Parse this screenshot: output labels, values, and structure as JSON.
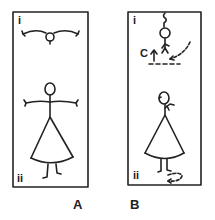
{
  "panels": [
    {
      "id": "A",
      "caption": "A",
      "top_label": "i",
      "bottom_label": "ii",
      "top_figure": "overhead view, arms outstretched",
      "bottom_figure": "front view, arms outstretched, cone skirt"
    },
    {
      "id": "B",
      "caption": "B",
      "top_label": "i",
      "bottom_label": "ii",
      "annotation": "C",
      "top_figure": "inverted figure with upward arrow and dashed line",
      "bottom_figure": "side view, arm bent, cone skirt, rotation arrow at feet"
    }
  ],
  "colors": {
    "ink": "#222222",
    "background": "#ffffff"
  }
}
